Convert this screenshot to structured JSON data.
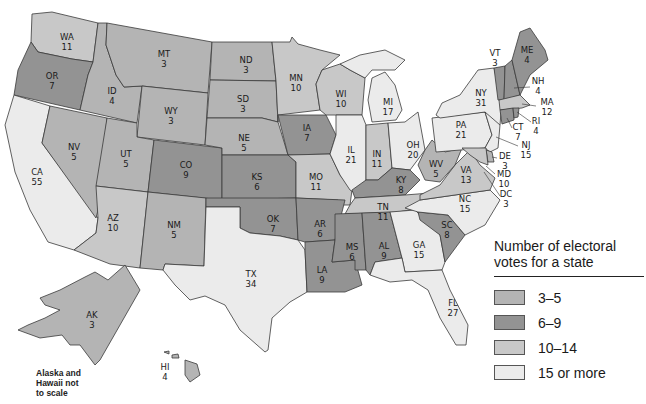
{
  "colors": {
    "c3_5": "#b4b4b4",
    "c6_9": "#939393",
    "c10_14": "#c8c8c8",
    "c15_plus": "#ebebeb",
    "stroke": "#3a3a3a"
  },
  "legend": {
    "title_line1": "Number of electoral",
    "title_line2": "votes for a state",
    "items": [
      {
        "label": "3–5",
        "color": "#b4b4b4"
      },
      {
        "label": "6–9",
        "color": "#939393"
      },
      {
        "label": "10–14",
        "color": "#c8c8c8"
      },
      {
        "label": "15 or more",
        "color": "#ebebeb"
      }
    ]
  },
  "note": {
    "line1": "Alaska and",
    "line2": "Hawaii not",
    "line3": "to scale"
  },
  "states": {
    "WA": {
      "abbr": "WA",
      "votes": "11"
    },
    "OR": {
      "abbr": "OR",
      "votes": "7"
    },
    "CA": {
      "abbr": "CA",
      "votes": "55"
    },
    "ID": {
      "abbr": "ID",
      "votes": "4"
    },
    "NV": {
      "abbr": "NV",
      "votes": "5"
    },
    "MT": {
      "abbr": "MT",
      "votes": "3"
    },
    "WY": {
      "abbr": "WY",
      "votes": "3"
    },
    "UT": {
      "abbr": "UT",
      "votes": "5"
    },
    "AZ": {
      "abbr": "AZ",
      "votes": "10"
    },
    "CO": {
      "abbr": "CO",
      "votes": "9"
    },
    "NM": {
      "abbr": "NM",
      "votes": "5"
    },
    "ND": {
      "abbr": "ND",
      "votes": "3"
    },
    "SD": {
      "abbr": "SD",
      "votes": "3"
    },
    "NE": {
      "abbr": "NE",
      "votes": "5"
    },
    "KS": {
      "abbr": "KS",
      "votes": "6"
    },
    "OK": {
      "abbr": "OK",
      "votes": "7"
    },
    "TX": {
      "abbr": "TX",
      "votes": "34"
    },
    "MN": {
      "abbr": "MN",
      "votes": "10"
    },
    "IA": {
      "abbr": "IA",
      "votes": "7"
    },
    "MO": {
      "abbr": "MO",
      "votes": "11"
    },
    "AR": {
      "abbr": "AR",
      "votes": "6"
    },
    "LA": {
      "abbr": "LA",
      "votes": "9"
    },
    "WI": {
      "abbr": "WI",
      "votes": "10"
    },
    "IL": {
      "abbr": "IL",
      "votes": "21"
    },
    "MI": {
      "abbr": "MI",
      "votes": "17"
    },
    "IN": {
      "abbr": "IN",
      "votes": "11"
    },
    "OH": {
      "abbr": "OH",
      "votes": "20"
    },
    "KY": {
      "abbr": "KY",
      "votes": "8"
    },
    "TN": {
      "abbr": "TN",
      "votes": "11"
    },
    "MS": {
      "abbr": "MS",
      "votes": "6"
    },
    "AL": {
      "abbr": "AL",
      "votes": "9"
    },
    "GA": {
      "abbr": "GA",
      "votes": "15"
    },
    "FL": {
      "abbr": "FL",
      "votes": "27"
    },
    "SC": {
      "abbr": "SC",
      "votes": "8"
    },
    "NC": {
      "abbr": "NC",
      "votes": "15"
    },
    "VA": {
      "abbr": "VA",
      "votes": "13"
    },
    "WV": {
      "abbr": "WV",
      "votes": "5"
    },
    "PA": {
      "abbr": "PA",
      "votes": "21"
    },
    "NY": {
      "abbr": "NY",
      "votes": "31"
    },
    "VT": {
      "abbr": "VT",
      "votes": "3"
    },
    "NH": {
      "abbr": "NH",
      "votes": "4"
    },
    "ME": {
      "abbr": "ME",
      "votes": "4"
    },
    "MA": {
      "abbr": "MA",
      "votes": "12"
    },
    "RI": {
      "abbr": "RI",
      "votes": "4"
    },
    "CT": {
      "abbr": "CT",
      "votes": "7"
    },
    "NJ": {
      "abbr": "NJ",
      "votes": "15"
    },
    "DE": {
      "abbr": "DE",
      "votes": "3"
    },
    "MD": {
      "abbr": "MD",
      "votes": "10"
    },
    "DC": {
      "abbr": "DC",
      "votes": "3"
    },
    "AK": {
      "abbr": "AK",
      "votes": "3"
    },
    "HI": {
      "abbr": "HI",
      "votes": "4"
    }
  }
}
